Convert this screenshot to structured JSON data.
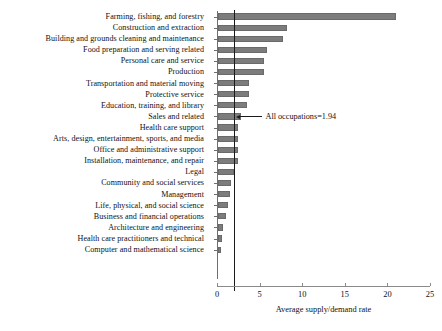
{
  "chart_data": {
    "type": "bar",
    "orientation": "horizontal",
    "title": "",
    "xlabel": "Average supply/demand rate",
    "ylabel": "",
    "xlim": [
      0,
      25
    ],
    "xticks": [
      0,
      5,
      10,
      15,
      20,
      25
    ],
    "grid": false,
    "legend": null,
    "bar_color": "#7c7c7c",
    "categories": [
      "Farming, fishing, and forestry",
      "Construction and extraction",
      "Building and grounds cleaning and maintenance",
      "Food preparation and serving related",
      "Personal care and service",
      "Production",
      "Transportation and material moving",
      "Protective service",
      "Education, training, and library",
      "Sales and related",
      "Health care support",
      "Arts, design, entertainment, sports, and media",
      "Office and administrative support",
      "Installation, maintenance, and repair",
      "Legal",
      "Community and social services",
      "Management",
      "Life, physical, and social science",
      "Business and financial operations",
      "Architecture and engineering",
      "Health care practitioners and technical",
      "Computer and mathematical science"
    ],
    "values": [
      20.9,
      8.1,
      7.6,
      5.75,
      5.4,
      5.4,
      3.6,
      3.6,
      3.4,
      2.7,
      2.3,
      2.3,
      2.3,
      2.3,
      1.9,
      1.5,
      1.35,
      1.2,
      0.95,
      0.6,
      0.45,
      0.35
    ],
    "annotations": [
      {
        "text": "All occupations=1.94",
        "value": 1.94,
        "type": "reference-line"
      }
    ]
  }
}
